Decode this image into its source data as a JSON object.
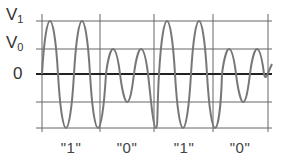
{
  "diagram": {
    "type": "signal-waveform",
    "y_labels": [
      {
        "main": "V",
        "sub": "1",
        "level": "V1"
      },
      {
        "main": "V",
        "sub": "0",
        "level": "V0"
      },
      {
        "main": "0",
        "sub": "",
        "level": "zero"
      }
    ],
    "bit_labels": [
      "\"1\"",
      "\"0\"",
      "\"1\"",
      "\"0\""
    ],
    "colors": {
      "grid": "#555555",
      "axis": "#222222",
      "wave": "#777777",
      "text": "#333333"
    }
  }
}
